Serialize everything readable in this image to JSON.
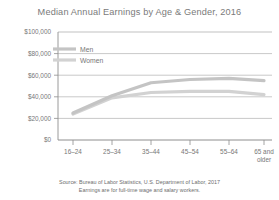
{
  "chart_data": {
    "type": "line",
    "title": "Median Annual Earnings by Age & Gender, 2016",
    "xlabel": "",
    "ylabel": "",
    "categories": [
      "16–24",
      "25–34",
      "35–44",
      "45–54",
      "55–64",
      "65 and older"
    ],
    "ylim": [
      0,
      100000
    ],
    "ytick_values": [
      0,
      20000,
      40000,
      60000,
      80000,
      100000
    ],
    "ytick_labels": [
      "$0",
      "$20,000",
      "$40,000",
      "$60,000",
      "$80,000",
      "$100,000"
    ],
    "grid": true,
    "legend_position": "top-left-inside",
    "series": [
      {
        "name": "Men",
        "color": "#c4c4c4",
        "values": [
          25000,
          41000,
          53000,
          56000,
          57000,
          55000
        ]
      },
      {
        "name": "Women",
        "color": "#d2d2d2",
        "values": [
          24000,
          39000,
          44000,
          45000,
          45000,
          42000
        ]
      }
    ],
    "source_lines": [
      "Source:  Bureau of Labor Statistics, U.S. Department of Labor, 2017",
      "Earnings are for full-time wage and salary workers."
    ]
  },
  "axis": {
    "line_color": "#9a9a9a",
    "grid_color": "#aaaaaa"
  }
}
